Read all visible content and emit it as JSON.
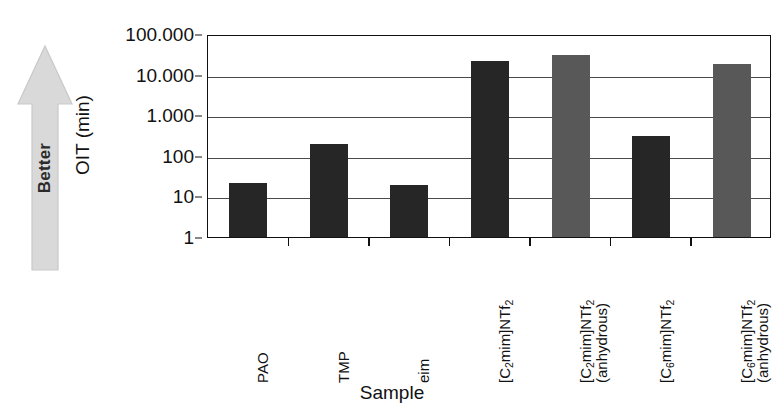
{
  "chart_data": {
    "type": "bar",
    "title": "",
    "xlabel": "Sample",
    "ylabel": "OIT (min)",
    "yscale": "log",
    "ylim": [
      1,
      100000
    ],
    "grid": true,
    "legend": "none",
    "y_tick_labels": [
      "100.000",
      "10.000",
      "1.000",
      "100",
      "10",
      "1"
    ],
    "y_tick_values": [
      100000,
      10000,
      1000,
      100,
      10,
      1
    ],
    "categories": [
      "PAO",
      "TMP",
      "eim",
      "[C2mim]NTf2",
      "[C2mim]NTf2 (anhydrous)",
      "[C6mim]NTf2",
      "[C6mim]NTf2 (anhydrous)"
    ],
    "values": [
      22,
      200,
      19,
      22000,
      30000,
      300,
      18000
    ],
    "bar_colors": [
      "black",
      "black",
      "black",
      "black",
      "gray",
      "black",
      "gray"
    ],
    "annotation": "Better"
  },
  "colors": {
    "bar_black": "#262626",
    "bar_gray": "#585858",
    "arrow_fill": "#d8d8d8",
    "axis": "#111111",
    "gridline": "#4a4a4a"
  },
  "axis": {
    "y_title": "OIT (min)",
    "x_title": "Sample"
  },
  "annotation": {
    "better_label": "Better"
  },
  "categories_rendered": [
    {
      "line1_pre": "PAO",
      "sub": "",
      "line1_post": "",
      "line2": ""
    },
    {
      "line1_pre": "TMP",
      "sub": "",
      "line1_post": "",
      "line2": ""
    },
    {
      "line1_pre": "eim",
      "sub": "",
      "line1_post": "",
      "line2": ""
    },
    {
      "line1_pre": "[C",
      "sub": "2",
      "line1_post": "mim]NTf",
      "sub2": "2",
      "line2": ""
    },
    {
      "line1_pre": "[C",
      "sub": "2",
      "line1_post": "mim]NTf",
      "sub2": "2",
      "line2": "(anhydrous)"
    },
    {
      "line1_pre": "[C",
      "sub": "6",
      "line1_post": "mim]NTf",
      "sub2": "2",
      "line2": ""
    },
    {
      "line1_pre": "[C",
      "sub": "6",
      "line1_post": "mim]NTf",
      "sub2": "2",
      "line2": "(anhydrous)"
    }
  ]
}
